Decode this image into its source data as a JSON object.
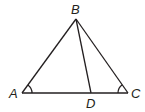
{
  "figure": {
    "type": "triangle",
    "stroke_color": "#231f20",
    "vertices": {
      "A": {
        "label": "A",
        "x": 22,
        "y": 93
      },
      "B": {
        "label": "B",
        "x": 76,
        "y": 19
      },
      "C": {
        "label": "C",
        "x": 128,
        "y": 93
      },
      "D": {
        "label": "D",
        "x": 91,
        "y": 93
      }
    },
    "segments": [
      "AB",
      "BC",
      "AC",
      "BD"
    ],
    "angle_marks": [
      "A",
      "C"
    ]
  }
}
